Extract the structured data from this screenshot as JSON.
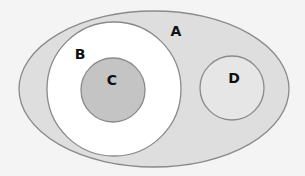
{
  "diagram": {
    "type": "venn-euler",
    "background": "#f4f4f4",
    "stroke_color": "#8a8a8a",
    "sets": [
      {
        "id": "A",
        "label": "A",
        "shape": "ellipse",
        "cx": 154,
        "cy": 89,
        "rx": 135,
        "ry": 78,
        "fill": "#dedede",
        "label_x": 176,
        "label_y": 32
      },
      {
        "id": "B",
        "label": "B",
        "shape": "circle",
        "cx": 114,
        "cy": 89,
        "r": 67,
        "fill": "#ffffff",
        "label_x": 80,
        "label_y": 55
      },
      {
        "id": "C",
        "label": "C",
        "shape": "circle",
        "cx": 113,
        "cy": 90,
        "r": 32,
        "fill": "#c4c4c4",
        "label_x": 112,
        "label_y": 81
      },
      {
        "id": "D",
        "label": "D",
        "shape": "circle",
        "cx": 232,
        "cy": 88,
        "r": 32,
        "fill": "#e6e6e6",
        "label_x": 234,
        "label_y": 79
      }
    ],
    "relationships": [
      "B is a subset of A",
      "C is a subset of B",
      "D is a subset of A",
      "B and D are disjoint"
    ]
  }
}
